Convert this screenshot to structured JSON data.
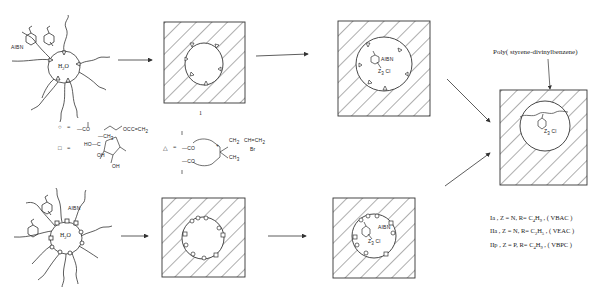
{
  "diagram": {
    "type": "reaction-scheme",
    "title_label": "Poly( styrene-divinylbenzene)",
    "top_row": {
      "micelle_labels": {
        "initiator": "AIBN",
        "core": "H2O",
        "core_main": "H",
        "core_sub": "2",
        "core_tail": "O"
      },
      "step1_label": "1",
      "step2_labels": {
        "initiator": "AIBN",
        "salt": "Z R Cl",
        "z": "Z",
        "sub": "3",
        "cl": "Cl"
      }
    },
    "bottom_row": {
      "micelle_labels": {
        "initiator": "AIBN",
        "core_main": "H",
        "core_sub": "2",
        "core_tail": "O"
      },
      "step2_labels": {
        "initiator": "AIBN",
        "z": "Z",
        "sub": "3",
        "cl": "Cl"
      }
    },
    "final": {
      "z": "Z",
      "sub": "3",
      "cl": "Cl"
    },
    "legend": {
      "circle": {
        "symbol": "○",
        "eq": "=",
        "formula": "—CO(CH₂)₂OCC=CH₂"
      },
      "square": {
        "symbol": "□",
        "eq": "=",
        "formula": "sugar ester (HO, OH, OH)"
      },
      "triangle": {
        "symbol": "△",
        "eq": "=",
        "formula": "—CO…N⁺(CH₃)CH₂-CH=CH₂ Br⁻"
      },
      "circle_text": "—CO",
      "circle_tail": "OCC=CH",
      "circle_tail_sub": "2",
      "sq_ch3": "—CH",
      "sq_ch3_sub": "3",
      "sq_ho": "HO—C",
      "sq_oh1": "OH",
      "sq_oh2": "OH",
      "tri_co1": "—CO",
      "tri_co2": "—CO",
      "tri_ch2": "CH",
      "tri_ch2_sub": "2",
      "tri_vinyl": "CH=CH",
      "tri_vinyl_sub": "2",
      "tri_br": "Br",
      "tri_ch3": "CH",
      "tri_ch3_sub": "3",
      "tri_plus": "+"
    },
    "series": [
      {
        "id": "Ia",
        "z": "Z = N",
        "r_main": "R= C",
        "r_sub1": "4",
        "r_h": "H",
        "r_sub2": "9",
        "code": "( VBAC )"
      },
      {
        "id": "IIa",
        "z": "Z = N",
        "r_main": "R= C",
        "r_sub1": "2",
        "r_h": "H",
        "r_sub2": "5",
        "code": "( VEAC )"
      },
      {
        "id": "IIp",
        "z": "Z = P",
        "r_main": "R= C",
        "r_sub1": "4",
        "r_h": "H",
        "r_sub2": "9",
        "code": "( VBPC )"
      }
    ],
    "series_labels": [
      "Ia ,",
      "IIa ,",
      "IIp ,"
    ]
  },
  "colors": {
    "ink": "#222222",
    "background": "#ffffff"
  }
}
